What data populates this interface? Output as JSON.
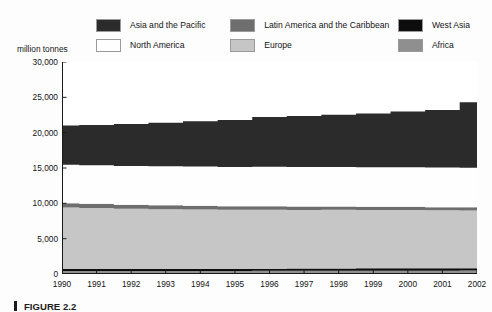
{
  "axis_title": "million tonnes",
  "caption": "FIGURE 2.2",
  "legend": {
    "rows": [
      [
        {
          "label": "Asia and the Pacific",
          "color": "#2b2b2b",
          "name": "legend-asia-pacific"
        },
        {
          "label": "Latin America and the Caribbean",
          "color": "#6e6e6e",
          "name": "legend-latin-america"
        },
        {
          "label": "West Asia",
          "color": "#0d0d0d",
          "name": "legend-west-asia"
        }
      ],
      [
        {
          "label": "North America",
          "color": "#fefefe",
          "name": "legend-north-america"
        },
        {
          "label": "Europe",
          "color": "#c6c6c6",
          "name": "legend-europe"
        },
        {
          "label": "Africa",
          "color": "#8f8f8f",
          "name": "legend-africa"
        }
      ]
    ]
  },
  "chart_data": {
    "type": "area",
    "stacked": true,
    "title": "",
    "subtitle": "",
    "xlabel": "",
    "ylabel": "million tonnes",
    "ylim": [
      0,
      30000
    ],
    "yticks": [
      0,
      5000,
      10000,
      15000,
      20000,
      25000,
      30000
    ],
    "ytick_labels": [
      "0",
      "5,000",
      "10,000",
      "15,000",
      "20,000",
      "25,000",
      "30,000"
    ],
    "grid": false,
    "legend_position": "top",
    "x": [
      1990,
      1991,
      1992,
      1993,
      1994,
      1995,
      1996,
      1997,
      1998,
      1999,
      2000,
      2001,
      2002
    ],
    "xtick_labels": [
      "1990",
      "1991",
      "1992",
      "1993",
      "1994",
      "1995",
      "1996",
      "1997",
      "1998",
      "1999",
      "2000",
      "2001",
      "2002"
    ],
    "series": [
      {
        "name": "Africa",
        "color": "#8f8f8f",
        "values": [
          420,
          420,
          430,
          430,
          440,
          440,
          450,
          450,
          460,
          460,
          470,
          470,
          480
        ]
      },
      {
        "name": "West Asia",
        "color": "#0d0d0d",
        "values": [
          330,
          330,
          300,
          300,
          300,
          300,
          300,
          320,
          320,
          340,
          340,
          350,
          350
        ]
      },
      {
        "name": "Europe",
        "color": "#c6c6c6",
        "values": [
          8650,
          8600,
          8500,
          8450,
          8400,
          8350,
          8350,
          8300,
          8300,
          8250,
          8250,
          8200,
          8170
        ]
      },
      {
        "name": "Latin America and the Caribbean",
        "color": "#6e6e6e",
        "values": [
          600,
          580,
          560,
          540,
          520,
          500,
          490,
          480,
          470,
          460,
          450,
          440,
          430
        ]
      },
      {
        "name": "North America",
        "color": "#fefefe",
        "values": [
          5450,
          5470,
          5500,
          5520,
          5540,
          5550,
          5570,
          5580,
          5580,
          5590,
          5600,
          5600,
          5600
        ]
      },
      {
        "name": "Asia and the Pacific",
        "color": "#2b2b2b",
        "values": [
          5550,
          5700,
          5950,
          6160,
          6400,
          6660,
          7040,
          7220,
          7420,
          7600,
          7890,
          8140,
          9270
        ]
      }
    ],
    "totals": [
      21000,
      21100,
      21240,
      21400,
      21600,
      21800,
      22200,
      22350,
      22550,
      22700,
      23000,
      23200,
      24300
    ]
  }
}
